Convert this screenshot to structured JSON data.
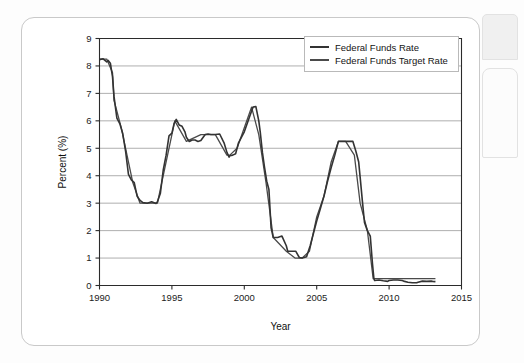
{
  "figure": {
    "card_name": "figure-card"
  },
  "chart_data": {
    "type": "line",
    "title": "",
    "xlabel": "Year",
    "ylabel": "Percent (%)",
    "xlim": [
      1990,
      2015
    ],
    "ylim": [
      0,
      9
    ],
    "xticks": [
      1990,
      1995,
      2000,
      2005,
      2010,
      2015
    ],
    "xtick_labels": [
      "1990",
      "1995",
      "2000",
      "2005",
      "2010",
      "2015"
    ],
    "yticks": [
      0,
      1,
      2,
      3,
      4,
      5,
      6,
      7,
      8,
      9
    ],
    "ytick_labels": [
      "0",
      "1",
      "2",
      "3",
      "4",
      "5",
      "6",
      "7",
      "8",
      "9"
    ],
    "grid": "horizontal",
    "legend_position": "top-right",
    "line_color": "#333333",
    "target_line_color": "#4a4a4a",
    "series": [
      {
        "name": "Federal Funds Rate",
        "x": [
          1990.0,
          1990.25,
          1990.5,
          1990.6,
          1990.75,
          1990.9,
          1991.0,
          1991.2,
          1991.4,
          1991.6,
          1991.8,
          1992.0,
          1992.2,
          1992.4,
          1992.6,
          1992.8,
          1993.0,
          1993.3,
          1993.6,
          1993.9,
          1994.0,
          1994.2,
          1994.4,
          1994.6,
          1994.8,
          1995.0,
          1995.15,
          1995.3,
          1995.5,
          1995.7,
          1995.9,
          1996.0,
          1996.2,
          1996.4,
          1996.6,
          1996.8,
          1997.0,
          1997.3,
          1997.5,
          1997.7,
          1997.9,
          1998.0,
          1998.3,
          1998.6,
          1998.8,
          1998.95,
          1999.0,
          1999.2,
          1999.4,
          1999.6,
          1999.8,
          2000.0,
          2000.2,
          2000.4,
          2000.6,
          2000.8,
          2001.0,
          2001.1,
          2001.25,
          2001.4,
          2001.55,
          2001.7,
          2001.85,
          2002.0,
          2002.3,
          2002.6,
          2002.9,
          2003.0,
          2003.3,
          2003.55,
          2003.8,
          2004.0,
          2004.3,
          2004.55,
          2004.8,
          2005.0,
          2005.25,
          2005.5,
          2005.75,
          2006.0,
          2006.25,
          2006.5,
          2006.75,
          2007.0,
          2007.25,
          2007.5,
          2007.7,
          2007.9,
          2008.0,
          2008.15,
          2008.3,
          2008.5,
          2008.7,
          2008.85,
          2008.95,
          2009.0,
          2009.3,
          2009.6,
          2009.9,
          2010.0,
          2010.3,
          2010.6,
          2010.9,
          2011.0,
          2011.3,
          2011.6,
          2011.9,
          2012.0,
          2012.3,
          2012.6,
          2012.9,
          2013.0,
          2013.2
        ],
        "y": [
          8.23,
          8.26,
          8.15,
          8.2,
          8.1,
          7.6,
          6.9,
          6.1,
          5.9,
          5.55,
          4.9,
          4.05,
          3.85,
          3.75,
          3.25,
          3.1,
          3.02,
          3.0,
          3.05,
          2.99,
          3.05,
          3.35,
          4.2,
          4.75,
          5.45,
          5.55,
          5.9,
          6.05,
          5.85,
          5.8,
          5.6,
          5.4,
          5.25,
          5.3,
          5.3,
          5.25,
          5.28,
          5.5,
          5.52,
          5.5,
          5.5,
          5.5,
          5.52,
          5.2,
          4.85,
          4.68,
          4.73,
          4.75,
          4.8,
          5.2,
          5.4,
          5.6,
          5.9,
          6.2,
          6.5,
          6.52,
          6.0,
          5.6,
          4.85,
          4.3,
          3.8,
          3.5,
          2.1,
          1.75,
          1.75,
          1.8,
          1.45,
          1.25,
          1.25,
          1.25,
          1.02,
          1.0,
          1.05,
          1.45,
          1.95,
          2.35,
          2.8,
          3.25,
          3.8,
          4.3,
          4.75,
          5.25,
          5.25,
          5.25,
          5.25,
          5.25,
          4.9,
          4.5,
          3.95,
          3.1,
          2.3,
          2.0,
          1.8,
          0.8,
          0.25,
          0.18,
          0.2,
          0.17,
          0.15,
          0.18,
          0.2,
          0.2,
          0.18,
          0.16,
          0.12,
          0.1,
          0.1,
          0.12,
          0.16,
          0.15,
          0.16,
          0.15,
          0.14
        ]
      },
      {
        "name": "Federal Funds Target Rate",
        "x": [
          1990.0,
          1990.5,
          1990.9,
          1991.0,
          1991.5,
          1991.9,
          1992.3,
          1992.8,
          1993.0,
          1994.0,
          1994.5,
          1995.0,
          1995.2,
          1996.0,
          1997.0,
          1998.0,
          1998.8,
          1999.0,
          1999.5,
          2000.0,
          2000.5,
          2001.0,
          2001.5,
          2002.0,
          2002.9,
          2003.5,
          2004.0,
          2004.5,
          2005.0,
          2005.5,
          2006.0,
          2006.5,
          2007.0,
          2007.6,
          2008.0,
          2008.5,
          2008.9,
          2009.0,
          2010.0,
          2011.0,
          2012.0,
          2013.2
        ],
        "y": [
          8.25,
          8.25,
          7.75,
          6.75,
          5.75,
          4.75,
          3.75,
          3.0,
          3.0,
          3.0,
          4.25,
          5.5,
          6.0,
          5.25,
          5.5,
          5.5,
          4.75,
          4.75,
          5.0,
          5.75,
          6.5,
          5.5,
          3.75,
          1.75,
          1.25,
          1.0,
          1.0,
          1.25,
          2.5,
          3.25,
          4.5,
          5.25,
          5.25,
          4.75,
          3.0,
          2.0,
          0.25,
          0.25,
          0.25,
          0.25,
          0.25,
          0.25
        ]
      }
    ],
    "legend": [
      {
        "label": "Federal Funds Rate",
        "icon": "line-swatch"
      },
      {
        "label": "Federal Funds Target Rate",
        "icon": "line-swatch"
      }
    ]
  }
}
